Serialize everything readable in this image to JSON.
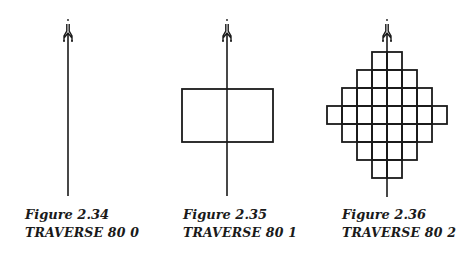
{
  "figures": [
    {
      "number": "Figure 2.34",
      "command": "TRAVERSE 80 0",
      "center_x": 68,
      "line_top": 40,
      "line_bottom": 196,
      "rects": []
    },
    {
      "number": "Figure 2.35",
      "command": "TRAVERSE 80 1",
      "center_x": 227,
      "line_top": 40,
      "line_bottom": 196,
      "rects": [
        {
          "x": 182,
          "y": 89,
          "w": 91,
          "h": 53
        }
      ]
    },
    {
      "number": "Figure 2.36",
      "command": "TRAVERSE 80 2",
      "center_x": 387,
      "line_top": 40,
      "line_bottom": 197,
      "grid": {
        "cell_w": 15,
        "cell_h": 18,
        "top": 52,
        "center_x": 387,
        "row_half_widths": [
          1,
          2,
          3,
          4,
          3,
          2,
          1
        ],
        "note": "rows of cells centered on the line; rows 3-4 boundary shown as widest band"
      }
    }
  ],
  "turtle_icon": "turtle-cursor-icon",
  "stroke_color": "#1a1a1a",
  "background": "#ffffff"
}
